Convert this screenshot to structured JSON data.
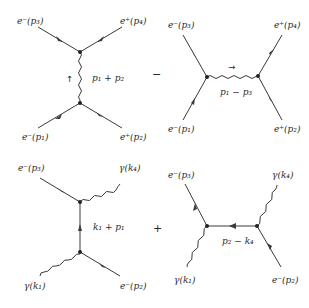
{
  "figure": {
    "operators": {
      "top_between": "−",
      "bottom_between": "+"
    },
    "diagrams": [
      {
        "id": "top-left",
        "description": "Bhabha scattering, annihilation (s-channel) diagram",
        "labels": {
          "top_left": "e⁻(p₃)",
          "top_right": "e⁺(p₄)",
          "bottom_left": "e⁻(p₁)",
          "bottom_right": "e⁺(p₂)",
          "propagator": "p₁ + p₂",
          "propagator_arrow": "↑"
        },
        "propagator_type": "photon",
        "propagator_orientation": "vertical"
      },
      {
        "id": "top-right",
        "description": "Bhabha scattering, exchange (t-channel) diagram",
        "labels": {
          "top_left": "e⁻(p₃)",
          "top_right": "e⁺(p₄)",
          "bottom_left": "e⁻(p₁)",
          "bottom_right": "e⁺(p₂)",
          "propagator": "p₁ − p₃",
          "propagator_arrow": "→"
        },
        "propagator_type": "photon",
        "propagator_orientation": "horizontal"
      },
      {
        "id": "bottom-left",
        "description": "Compton scattering, s-channel diagram",
        "labels": {
          "top_left": "e⁻(p₃)",
          "top_right": "γ(k₄)",
          "bottom_left": "γ(k₁)",
          "bottom_right": "e⁻(p₂)",
          "propagator": "k₁ + p₁"
        },
        "propagator_type": "electron",
        "propagator_orientation": "vertical"
      },
      {
        "id": "bottom-right",
        "description": "Compton scattering, u-channel diagram",
        "labels": {
          "top_left": "e⁻(p₃)",
          "top_right": "γ(k₄)",
          "bottom_left": "γ(k₁)",
          "bottom_right": "e⁻(p₂)",
          "propagator": "p₂ − k₄"
        },
        "propagator_type": "electron",
        "propagator_orientation": "horizontal"
      }
    ]
  }
}
